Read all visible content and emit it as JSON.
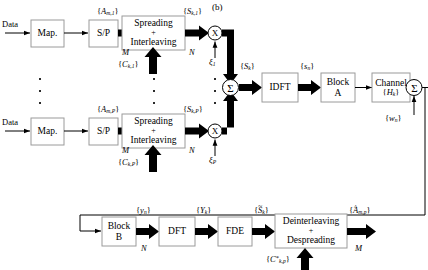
{
  "figure": {
    "panel_label": "(b)",
    "caption_omitted": true
  },
  "blocks": {
    "map_top": {
      "line1": "Map."
    },
    "sp_top": {
      "line1": "S/P"
    },
    "spread_top": {
      "line1": "Spreading",
      "line2": "+",
      "line3": "Interleaving"
    },
    "map_bot": {
      "line1": "Map."
    },
    "sp_bot": {
      "line1": "S/P"
    },
    "spread_bot": {
      "line1": "Spreading",
      "line2": "+",
      "line3": "Interleaving"
    },
    "idft": {
      "line1": "IDFT"
    },
    "block_a": {
      "line1": "Block",
      "line2": "A"
    },
    "channel": {
      "line1": "Channel",
      "line2_base": "H",
      "line2_sub": "k"
    },
    "block_b": {
      "line1": "Block",
      "line2": "B"
    },
    "dft": {
      "line1": "DFT"
    },
    "fde": {
      "line1": "FDE"
    },
    "despread": {
      "line1": "Deinterleaving",
      "line2": "+",
      "line3": "Despreading"
    }
  },
  "operators": {
    "mult_top": "X",
    "mult_bot": "X",
    "sum_branch": "Σ",
    "sum_noise": "Σ"
  },
  "signals": {
    "data_top": "Data",
    "data_bot": "Data",
    "a_top": {
      "base": "A",
      "sub": "m,1"
    },
    "a_bot": {
      "base": "A",
      "sub": "m,P"
    },
    "s_top": {
      "base": "S",
      "sub": "k,1"
    },
    "s_bot": {
      "base": "S",
      "sub": "k,P"
    },
    "c_top": {
      "base": "C",
      "sub": "k,1"
    },
    "c_bot": {
      "base": "C",
      "sub": "k,P"
    },
    "xi_top": {
      "base": "ξ",
      "sub": "1"
    },
    "xi_bot": {
      "base": "ξ",
      "sub": "P"
    },
    "s_sum": {
      "base": "S",
      "sub": "k"
    },
    "s_time": {
      "base": "s",
      "sub": "n"
    },
    "noise": {
      "base": "w",
      "sub": "n"
    },
    "y_time": {
      "base": "y",
      "sub": "n"
    },
    "y_freq": {
      "base": "Y",
      "sub": "k"
    },
    "s_hat": {
      "base": "S",
      "sub": "k",
      "accent": "tilde"
    },
    "a_hat": {
      "base": "A",
      "sub": "m,p",
      "accent": "hat"
    },
    "c_conj": {
      "base": "C",
      "sup": "*",
      "sub": "k,p"
    }
  },
  "counts": {
    "m_top": "M",
    "n_top": "N",
    "m_bot": "M",
    "n_bot": "N",
    "n_rx": "N",
    "m_rx": "M"
  },
  "colors": {
    "stroke": "#000000",
    "box_border": "#9a9a9a",
    "background": "#ffffff"
  }
}
